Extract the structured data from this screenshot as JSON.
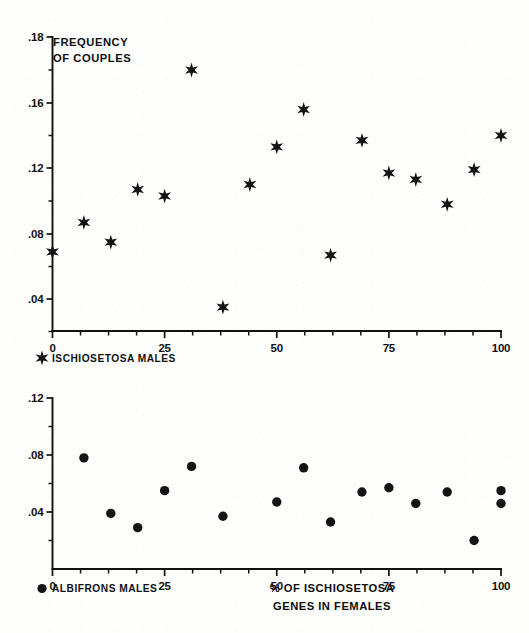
{
  "figure": {
    "background_color": "#fdfdfc",
    "ink_color": "#141414"
  },
  "axis_title": {
    "line1": "% OF ISCHIOSETOSA",
    "line2": "GENES IN FEMALES"
  },
  "top_panel": {
    "title_line1": "FREQUENCY",
    "title_line2": "OF  COUPLES",
    "legend_label": "ISCHIOSETOSA   MALES",
    "legend_marker": "star-marker"
  },
  "bottom_panel": {
    "legend_label": "ALBIFRONS   MALES",
    "legend_marker": "circle-marker"
  },
  "chart_data": [
    {
      "type": "scatter",
      "id": "top-panel",
      "title": "FREQUENCY OF COUPLES",
      "xlabel": "% OF ISCHIOSETOSA GENES IN FEMALES",
      "ylabel": "FREQUENCY OF COUPLES",
      "series_name": "ISCHIOSETOSA MALES",
      "marker": "star",
      "grid": false,
      "legend_position": "below-axis-left",
      "xlim": [
        0,
        100
      ],
      "ylim": [
        0.02,
        0.18
      ],
      "xticks": [
        0,
        25,
        50,
        75,
        100
      ],
      "xtick_labels": [
        "0",
        "25",
        "50",
        "75",
        "100"
      ],
      "xticks_minor": [
        6.25,
        12.5,
        18.75,
        31.25,
        37.5,
        43.75,
        56.25,
        62.5,
        68.75,
        81.25,
        87.5,
        93.75
      ],
      "yticks": [
        0.18,
        0.16,
        0.12,
        0.08,
        0.04
      ],
      "ytick_labels": [
        ".18",
        ".16",
        ".12",
        ".08",
        ".04"
      ],
      "yticks_minor": [
        0.17,
        0.14,
        0.1,
        0.06,
        0.02
      ],
      "x": [
        0,
        7,
        13,
        19,
        25,
        31,
        38,
        44,
        50,
        56,
        62,
        69,
        75,
        81,
        88,
        94,
        100
      ],
      "y": [
        0.069,
        0.087,
        0.075,
        0.107,
        0.103,
        0.17,
        0.035,
        0.11,
        0.133,
        0.156,
        0.067,
        0.137,
        0.117,
        0.113,
        0.098,
        0.119,
        0.14
      ]
    },
    {
      "type": "scatter",
      "id": "bottom-panel",
      "title": "",
      "xlabel": "% OF ISCHIOSETOSA GENES IN FEMALES",
      "ylabel": "",
      "series_name": "ALBIFRONS MALES",
      "marker": "circle",
      "grid": false,
      "legend_position": "below-axis-left",
      "xlim": [
        0,
        100
      ],
      "ylim": [
        0.0,
        0.12
      ],
      "xticks": [
        0,
        25,
        50,
        75,
        100
      ],
      "xtick_labels": [
        "0",
        "25",
        "50",
        "75",
        "100"
      ],
      "xticks_minor": [
        6.25,
        12.5,
        18.75,
        31.25,
        37.5,
        43.75,
        56.25,
        62.5,
        68.75,
        81.25,
        87.5,
        93.75
      ],
      "yticks": [
        0.12,
        0.08,
        0.04
      ],
      "ytick_labels": [
        ".12",
        ".08",
        ".04"
      ],
      "yticks_minor": [
        0.1,
        0.06,
        0.02
      ],
      "x": [
        7,
        13,
        19,
        25,
        31,
        38,
        50,
        56,
        62,
        69,
        75,
        81,
        88,
        94,
        100,
        100
      ],
      "y": [
        0.078,
        0.039,
        0.029,
        0.055,
        0.072,
        0.037,
        0.047,
        0.071,
        0.033,
        0.054,
        0.057,
        0.046,
        0.054,
        0.02,
        0.055,
        0.046
      ]
    }
  ]
}
